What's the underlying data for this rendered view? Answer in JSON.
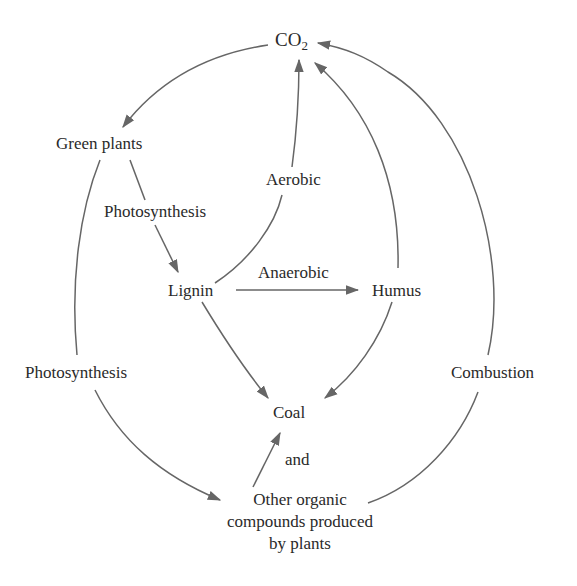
{
  "diagram": {
    "nodes": {
      "co2": {
        "main": "CO",
        "sub": "2"
      },
      "green_plants": "Green plants",
      "lignin": "Lignin",
      "humus": "Humus",
      "coal": "Coal",
      "other": {
        "line1": "Other organic",
        "line2": "compounds produced",
        "line3": "by plants"
      }
    },
    "edge_labels": {
      "photosynthesis_inner": "Photosynthesis",
      "photosynthesis_outer": "Photosynthesis",
      "aerobic": "Aerobic",
      "anaerobic": "Anaerobic",
      "combustion": "Combustion",
      "and": "and"
    },
    "edges": [
      {
        "from": "CO2",
        "to": "Green plants"
      },
      {
        "from": "Green plants",
        "to": "Lignin",
        "label": "Photosynthesis"
      },
      {
        "from": "Green plants",
        "to": "Other organic compounds produced by plants",
        "label": "Photosynthesis"
      },
      {
        "from": "Lignin",
        "to": "CO2",
        "label": "Aerobic"
      },
      {
        "from": "Lignin",
        "to": "Humus",
        "label": "Anaerobic"
      },
      {
        "from": "Humus",
        "to": "CO2"
      },
      {
        "from": "Lignin",
        "to": "Coal"
      },
      {
        "from": "Humus",
        "to": "Coal"
      },
      {
        "from": "Other organic compounds produced by plants",
        "to": "Coal",
        "label": "and"
      },
      {
        "from": "Other organic compounds produced by plants",
        "to": "CO2",
        "label": "Combustion"
      }
    ],
    "colors": {
      "stroke": "#666666",
      "text": "#2a2a2a",
      "background": "#ffffff"
    }
  }
}
